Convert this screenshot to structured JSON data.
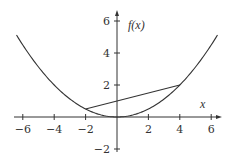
{
  "chart_data": {
    "type": "line",
    "title": "",
    "xlabel": "x",
    "ylabel": "f(x)",
    "xlim": [
      -6.5,
      6.5
    ],
    "ylim": [
      -2.5,
      6.5
    ],
    "grid": false,
    "x_ticks": [
      -6,
      -4,
      -2,
      2,
      4,
      6
    ],
    "x_tick_labels": [
      "−6",
      "−4",
      "−2",
      "2",
      "4",
      "6"
    ],
    "y_ticks": [
      6,
      4,
      2,
      -2
    ],
    "y_tick_labels": [
      "6",
      "4",
      "2",
      "−2"
    ],
    "series": [
      {
        "name": "f(x)",
        "kind": "curve",
        "formula": "x^2/8",
        "x": [
          -6.4,
          -6,
          -5,
          -4,
          -3,
          -2,
          -1,
          0,
          1,
          2,
          3,
          4,
          5,
          6,
          6.4
        ],
        "y": [
          5.12,
          4.5,
          3.125,
          2,
          1.125,
          0.5,
          0.125,
          0,
          0.125,
          0.5,
          1.125,
          2,
          3.125,
          4.5,
          5.12
        ]
      },
      {
        "name": "secant",
        "kind": "segment",
        "x": [
          -2,
          4
        ],
        "y": [
          0.5,
          2
        ]
      }
    ]
  }
}
